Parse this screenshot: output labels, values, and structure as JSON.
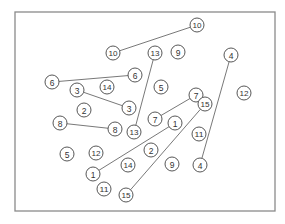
{
  "diagram": {
    "title": "",
    "frame": {
      "x": 15,
      "y": 12,
      "width": 260,
      "height": 199,
      "stroke": "#8a8a8a"
    },
    "node_radius": 7,
    "nodes": [
      {
        "id": "n10a",
        "label": "10",
        "x": 197,
        "y": 25
      },
      {
        "id": "n10b",
        "label": "10",
        "x": 113,
        "y": 53
      },
      {
        "id": "n13a",
        "label": "13",
        "x": 155,
        "y": 53
      },
      {
        "id": "n9a",
        "label": "9",
        "x": 178,
        "y": 52
      },
      {
        "id": "n4a",
        "label": "4",
        "x": 231,
        "y": 55
      },
      {
        "id": "n6a",
        "label": "6",
        "x": 52,
        "y": 82
      },
      {
        "id": "n6b",
        "label": "6",
        "x": 135,
        "y": 75
      },
      {
        "id": "n3a",
        "label": "3",
        "x": 77,
        "y": 90
      },
      {
        "id": "n14a",
        "label": "14",
        "x": 107,
        "y": 87
      },
      {
        "id": "n5a",
        "label": "5",
        "x": 161,
        "y": 87
      },
      {
        "id": "n7a",
        "label": "7",
        "x": 196,
        "y": 95
      },
      {
        "id": "n12a",
        "label": "12",
        "x": 244,
        "y": 93
      },
      {
        "id": "n2a",
        "label": "2",
        "x": 84,
        "y": 110
      },
      {
        "id": "n3b",
        "label": "3",
        "x": 129,
        "y": 108
      },
      {
        "id": "n15a",
        "label": "15",
        "x": 205,
        "y": 104
      },
      {
        "id": "n7b",
        "label": "7",
        "x": 155,
        "y": 119
      },
      {
        "id": "n1a",
        "label": "1",
        "x": 175,
        "y": 123
      },
      {
        "id": "n8a",
        "label": "8",
        "x": 60,
        "y": 123
      },
      {
        "id": "n8b",
        "label": "8",
        "x": 115,
        "y": 129
      },
      {
        "id": "n13b",
        "label": "13",
        "x": 134,
        "y": 132
      },
      {
        "id": "n11a",
        "label": "11",
        "x": 199,
        "y": 134
      },
      {
        "id": "n5b",
        "label": "5",
        "x": 67,
        "y": 154
      },
      {
        "id": "n12b",
        "label": "12",
        "x": 96,
        "y": 153
      },
      {
        "id": "n2b",
        "label": "2",
        "x": 151,
        "y": 150
      },
      {
        "id": "n14b",
        "label": "14",
        "x": 128,
        "y": 165
      },
      {
        "id": "n9b",
        "label": "9",
        "x": 172,
        "y": 164
      },
      {
        "id": "n4b",
        "label": "4",
        "x": 200,
        "y": 165
      },
      {
        "id": "n1b",
        "label": "1",
        "x": 93,
        "y": 174
      },
      {
        "id": "n11b",
        "label": "11",
        "x": 104,
        "y": 189
      },
      {
        "id": "n15b",
        "label": "15",
        "x": 126,
        "y": 195
      }
    ],
    "edges": [
      {
        "from": "n10a",
        "to": "n10b"
      },
      {
        "from": "n6a",
        "to": "n6b"
      },
      {
        "from": "n3a",
        "to": "n3b"
      },
      {
        "from": "n8a",
        "to": "n8b"
      },
      {
        "from": "n13a",
        "to": "n13b"
      },
      {
        "from": "n7a",
        "to": "n7b"
      },
      {
        "from": "n1a",
        "to": "n1b"
      },
      {
        "from": "n15a",
        "to": "n15b"
      },
      {
        "from": "n4a",
        "to": "n4b"
      }
    ]
  }
}
